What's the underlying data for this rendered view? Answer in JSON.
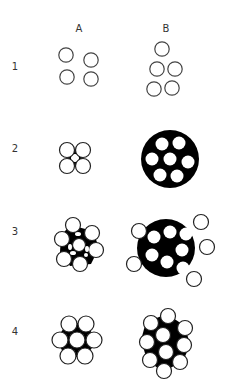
{
  "columns": [
    {
      "label": "A",
      "x": 79,
      "y": 29
    },
    {
      "label": "B",
      "x": 166,
      "y": 29
    }
  ],
  "rows": [
    {
      "label": "1",
      "x": 15,
      "y": 67
    },
    {
      "label": "2",
      "x": 15,
      "y": 149
    },
    {
      "label": "3",
      "x": 15,
      "y": 232
    },
    {
      "label": "4",
      "x": 15,
      "y": 332
    }
  ],
  "colors": {
    "ink": "#000000",
    "paper": "#ffffff",
    "outline": "#444444",
    "text": "#333333"
  },
  "figures": {
    "row1": {
      "A": {
        "description": "4 separate open circles",
        "circles": [
          [
            66,
            55
          ],
          [
            91,
            60
          ],
          [
            67,
            77
          ],
          [
            91,
            79
          ]
        ]
      },
      "B": {
        "description": "5 separate open circles",
        "circles": [
          [
            162,
            49
          ],
          [
            157,
            69
          ],
          [
            175,
            69
          ],
          [
            154,
            89
          ],
          [
            172,
            88
          ]
        ]
      }
    },
    "row2": {
      "A": {
        "description": "4 touching circles with black interstices"
      },
      "B": {
        "description": "large black disc with 7 white circles inside"
      }
    },
    "row3": {
      "A": {
        "description": "cluster of ~9 circles with black interstices"
      },
      "B": {
        "description": "large black disc with 8 white circles inside and 4 protruding outer circles"
      }
    },
    "row4": {
      "A": {
        "description": "hexagonal cluster of 7 circles with black interstices"
      },
      "B": {
        "description": "cluster of 10 circles with black interstices"
      }
    }
  }
}
